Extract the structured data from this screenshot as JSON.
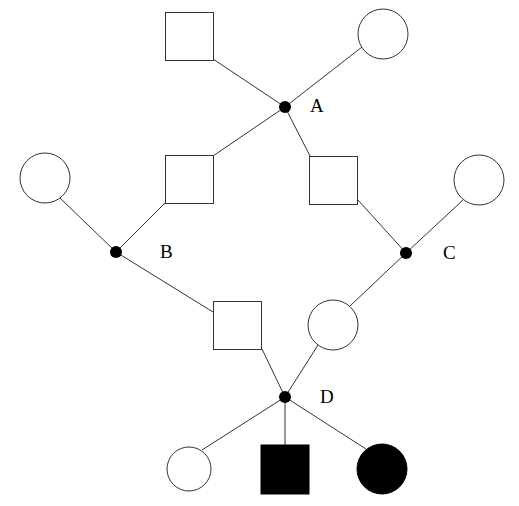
{
  "diagram": {
    "type": "pedigree",
    "nodes": [
      {
        "id": "A",
        "label": "A",
        "x": 285,
        "y": 107
      },
      {
        "id": "B",
        "label": "B",
        "x": 116,
        "y": 252
      },
      {
        "id": "C",
        "label": "C",
        "x": 406,
        "y": 253
      },
      {
        "id": "D",
        "label": "D",
        "x": 285,
        "y": 397
      }
    ],
    "individuals": [
      {
        "id": "gp_male",
        "sex": "male",
        "affected": false,
        "x": 190,
        "y": 36
      },
      {
        "id": "gp_female",
        "sex": "female",
        "affected": false,
        "x": 383,
        "y": 34
      },
      {
        "id": "b_mother",
        "sex": "female",
        "affected": false,
        "x": 45,
        "y": 178
      },
      {
        "id": "a_son_left",
        "sex": "male",
        "affected": false,
        "x": 190,
        "y": 179
      },
      {
        "id": "a_son_right",
        "sex": "male",
        "affected": false,
        "x": 334,
        "y": 180
      },
      {
        "id": "c_mother",
        "sex": "female",
        "affected": false,
        "x": 479,
        "y": 180
      },
      {
        "id": "d_father",
        "sex": "male",
        "affected": false,
        "x": 238,
        "y": 325
      },
      {
        "id": "d_mother",
        "sex": "female",
        "affected": false,
        "x": 333,
        "y": 325
      },
      {
        "id": "child_1",
        "sex": "female",
        "affected": false,
        "x": 189,
        "y": 469
      },
      {
        "id": "child_2",
        "sex": "male",
        "affected": true,
        "x": 285,
        "y": 469
      },
      {
        "id": "child_3",
        "sex": "female",
        "affected": true,
        "x": 382,
        "y": 469
      }
    ]
  },
  "labels": {
    "A": "A",
    "B": "B",
    "C": "C",
    "D": "D"
  }
}
